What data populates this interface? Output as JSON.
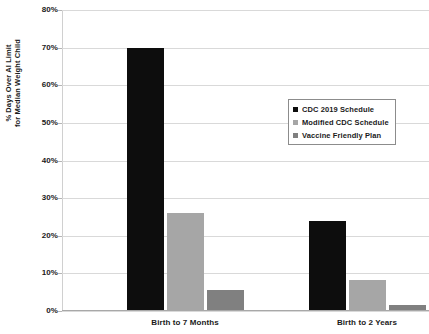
{
  "chart_data": {
    "type": "bar",
    "title": "",
    "xlabel": "",
    "ylabel": "% Days Over AI Limit for Median Weight Child",
    "ylabel_line1": "% Days Over AI Limit",
    "ylabel_line2": "for Median Weight Child",
    "categories": [
      "Birth to 7 Months",
      "Birth to 2 Years"
    ],
    "series": [
      {
        "name": "CDC 2019 Schedule",
        "color": "#0d0d0d",
        "values": [
          70,
          24
        ]
      },
      {
        "name": "Modified CDC Schedule",
        "color": "#a6a6a6",
        "values": [
          26,
          8.3
        ]
      },
      {
        "name": "Vaccine Friendly Plan",
        "color": "#808080",
        "values": [
          5.5,
          1.7
        ]
      }
    ],
    "ylim": [
      0,
      80
    ],
    "ytick_values": [
      80,
      70,
      60,
      50,
      40,
      30,
      20,
      10,
      0
    ],
    "ytick_labels": [
      "80%",
      "70%",
      "60%",
      "50%",
      "40%",
      "30%",
      "20%",
      "10%",
      "0%"
    ],
    "grid": true,
    "legend_position": "center-right",
    "legend_entries": [
      "CDC 2019 Schedule",
      "Modified CDC Schedule",
      "Vaccine Friendly Plan"
    ]
  }
}
